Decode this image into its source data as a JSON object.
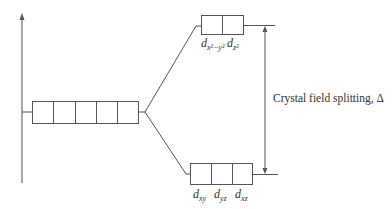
{
  "diagram": {
    "type": "energy-level",
    "caption": "Crystal field splitting, Δ",
    "colors": {
      "line": "#555555",
      "text": "#333333",
      "background": "#ffffff"
    },
    "degenerate_set": {
      "orbitals": 5
    },
    "upper_set": {
      "orbitals": [
        {
          "base": "d",
          "sub": "x²−y²"
        },
        {
          "base": "d",
          "sub": "z²"
        }
      ]
    },
    "lower_set": {
      "orbitals": [
        {
          "base": "d",
          "sub": "xy"
        },
        {
          "base": "d",
          "sub": "yz"
        },
        {
          "base": "d",
          "sub": "xz"
        }
      ]
    }
  }
}
